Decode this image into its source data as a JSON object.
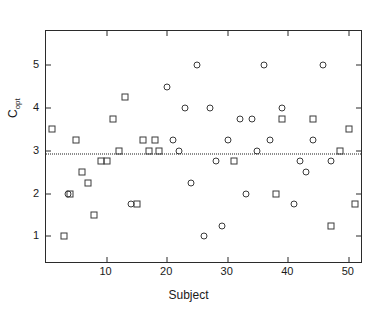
{
  "chart_data": {
    "type": "scatter",
    "title": "",
    "xlabel": "Subject",
    "ylabel": "C_opt",
    "ylabel_base": "C",
    "ylabel_sub": "opt",
    "xlim": [
      0,
      52
    ],
    "ylim": [
      0.4,
      5.8
    ],
    "xticks": [
      10,
      20,
      30,
      40,
      50
    ],
    "xticklabels": [
      "10",
      "20",
      "30",
      "40",
      "50"
    ],
    "yticks": [
      1,
      2,
      3,
      4,
      5
    ],
    "yticklabels": [
      "1",
      "2",
      "3",
      "4",
      "5"
    ],
    "grid": false,
    "legend": "none",
    "marker_color": "#3a3a3a",
    "axis_color": "#2b2b2b",
    "background": "#ffffff",
    "annotations": [
      {
        "type": "hline",
        "name": "mean-reference-line",
        "y": 2.93,
        "style": "dotted",
        "color": "#1a1a1a"
      }
    ],
    "series": [
      {
        "name": "squares",
        "marker": "square",
        "points": [
          {
            "x": 1,
            "y": 3.5
          },
          {
            "x": 3,
            "y": 1.0
          },
          {
            "x": 4,
            "y": 2.0
          },
          {
            "x": 5,
            "y": 3.25
          },
          {
            "x": 6,
            "y": 2.5
          },
          {
            "x": 7,
            "y": 2.25
          },
          {
            "x": 8,
            "y": 1.5
          },
          {
            "x": 9,
            "y": 2.75
          },
          {
            "x": 10,
            "y": 2.75
          },
          {
            "x": 11,
            "y": 3.75
          },
          {
            "x": 12,
            "y": 3.0
          },
          {
            "x": 13,
            "y": 4.25
          },
          {
            "x": 15,
            "y": 1.75
          },
          {
            "x": 16,
            "y": 3.25
          },
          {
            "x": 17,
            "y": 3.0
          },
          {
            "x": 18,
            "y": 3.25
          },
          {
            "x": 18.6,
            "y": 3.0
          },
          {
            "x": 31,
            "y": 2.75
          },
          {
            "x": 38,
            "y": 2.0
          },
          {
            "x": 39,
            "y": 3.75
          },
          {
            "x": 44,
            "y": 3.75
          },
          {
            "x": 47,
            "y": 1.25
          },
          {
            "x": 48.5,
            "y": 3.0
          },
          {
            "x": 50,
            "y": 3.5
          },
          {
            "x": 51,
            "y": 1.75
          }
        ]
      },
      {
        "name": "circles",
        "marker": "circle",
        "points": [
          {
            "x": 3.6,
            "y": 2.0
          },
          {
            "x": 14,
            "y": 1.75
          },
          {
            "x": 20,
            "y": 4.5
          },
          {
            "x": 21,
            "y": 3.25
          },
          {
            "x": 22,
            "y": 3.0
          },
          {
            "x": 23,
            "y": 4.0
          },
          {
            "x": 24,
            "y": 2.25
          },
          {
            "x": 25,
            "y": 5.0
          },
          {
            "x": 26,
            "y": 1.0
          },
          {
            "x": 27,
            "y": 4.0
          },
          {
            "x": 28,
            "y": 2.75
          },
          {
            "x": 29,
            "y": 1.25
          },
          {
            "x": 30,
            "y": 3.25
          },
          {
            "x": 32,
            "y": 3.75
          },
          {
            "x": 33,
            "y": 2.0
          },
          {
            "x": 34,
            "y": 3.75
          },
          {
            "x": 34.8,
            "y": 3.0
          },
          {
            "x": 36,
            "y": 5.0
          },
          {
            "x": 37,
            "y": 3.25
          },
          {
            "x": 39,
            "y": 4.0
          },
          {
            "x": 41,
            "y": 1.75
          },
          {
            "x": 42,
            "y": 2.75
          },
          {
            "x": 43,
            "y": 2.5
          },
          {
            "x": 44,
            "y": 3.25
          },
          {
            "x": 45.8,
            "y": 5.0
          },
          {
            "x": 47,
            "y": 2.75
          }
        ]
      }
    ]
  }
}
